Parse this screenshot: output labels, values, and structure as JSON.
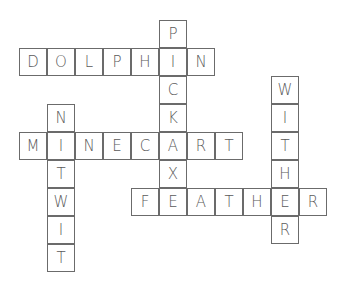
{
  "puzzle": {
    "type": "crossword",
    "cell_size": 28,
    "colors": {
      "border": "#6b6b6b",
      "text": "#5a5a5a",
      "background": "#ffffff"
    },
    "words": [
      {
        "word": "PICKAX",
        "direction": "down",
        "row": 0,
        "col": 5
      },
      {
        "word": "DOLPHIN",
        "direction": "across",
        "row": 1,
        "col": 0
      },
      {
        "word": "WITHER",
        "direction": "down",
        "row": 2,
        "col": 9
      },
      {
        "word": "NITWIT",
        "direction": "down",
        "row": 3,
        "col": 1
      },
      {
        "word": "MINECART",
        "direction": "across",
        "row": 4,
        "col": 0
      },
      {
        "word": "FEATHER",
        "direction": "across",
        "row": 6,
        "col": 4
      }
    ]
  }
}
